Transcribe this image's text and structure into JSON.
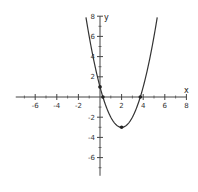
{
  "chart_data": {
    "type": "line",
    "title": "",
    "xlabel": "x",
    "ylabel": "y",
    "xlim": [
      -7.8,
      8
    ],
    "ylim": [
      -7.8,
      8
    ],
    "x_ticks": [
      -6,
      -4,
      -2,
      2,
      4,
      6,
      8
    ],
    "y_ticks": [
      8,
      6,
      4,
      2,
      -2,
      -4,
      -6
    ],
    "grid": false,
    "legend": null,
    "series": [
      {
        "name": "y = x^2 - 4x + 1",
        "domain": [
          -1.5,
          5.5
        ],
        "color": "#333333"
      }
    ],
    "marked_points": [
      {
        "label": "y-intercept",
        "x": 0,
        "y": 1
      },
      {
        "label": "root-left",
        "x": 0.27,
        "y": 0
      },
      {
        "label": "vertex",
        "x": 2,
        "y": -3
      },
      {
        "label": "root-right",
        "x": 3.73,
        "y": 0
      }
    ]
  }
}
